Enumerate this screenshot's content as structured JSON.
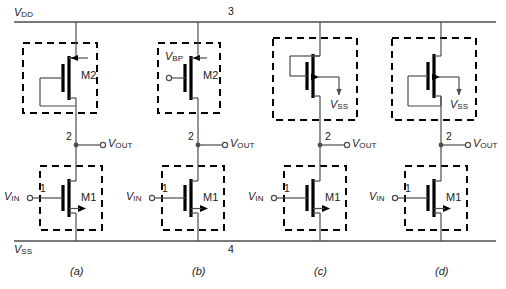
{
  "figure": {
    "rails": {
      "top_label": "V",
      "top_label_sub": "DD",
      "top_node": "3",
      "bottom_label": "V",
      "bottom_label_sub": "SS",
      "bottom_node": "4"
    },
    "common": {
      "vin_label": "V",
      "vin_sub": "IN",
      "vout_label": "V",
      "vout_sub": "OUT",
      "vss_label": "V",
      "vss_sub": "SS",
      "vbp_label": "V",
      "vbp_sub": "BP",
      "input_node": "1",
      "output_node": "2",
      "load_device": "M2",
      "driver_device": "M1"
    },
    "circuits": [
      {
        "caption": "(a)",
        "load_type": "diode-connected-pmos",
        "load_name": "M2",
        "has_gate_terminal": false,
        "has_body_arrow": false,
        "driver_name": "M1",
        "input_terminal": "V",
        "input_sub": "IN",
        "input_node": "1",
        "output_node": "2",
        "output_terminal": "V",
        "output_sub": "OUT"
      },
      {
        "caption": "(b)",
        "load_type": "biased-pmos",
        "load_name": "M2",
        "has_gate_terminal": true,
        "gate_terminal": "V",
        "gate_sub": "BP",
        "has_body_arrow": false,
        "driver_name": "M1",
        "input_terminal": "V",
        "input_sub": "IN",
        "input_node": "1",
        "output_node": "2",
        "output_terminal": "V",
        "output_sub": "OUT"
      },
      {
        "caption": "(c)",
        "load_type": "nmos-gate-to-drain-body-vss",
        "load_name": "",
        "has_gate_terminal": false,
        "has_body_arrow": true,
        "body_terminal": "V",
        "body_sub": "SS",
        "driver_name": "M1",
        "input_terminal": "V",
        "input_sub": "IN",
        "input_node": "1",
        "output_node": "2",
        "output_terminal": "V",
        "output_sub": "OUT"
      },
      {
        "caption": "(d)",
        "load_type": "nmos-gate-to-source-body-vss",
        "load_name": "",
        "has_gate_terminal": false,
        "has_body_arrow": true,
        "body_terminal": "V",
        "body_sub": "SS",
        "driver_name": "M1",
        "input_terminal": "V",
        "input_sub": "IN",
        "input_node": "1",
        "output_node": "2",
        "output_terminal": "V",
        "output_sub": "OUT"
      }
    ],
    "colors": {
      "wire": "#4d4d4d",
      "device": "#000000",
      "dashed_box": "#000000",
      "text": "#1a1a1a"
    }
  }
}
